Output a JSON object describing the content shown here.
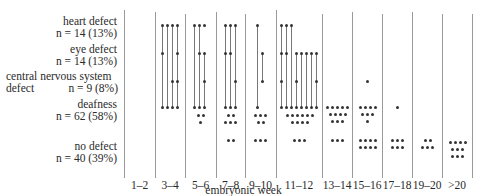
{
  "rows": [
    {
      "key": "heart",
      "label": "heart defect",
      "n": "n = 14 (13%)",
      "y": 25
    },
    {
      "key": "eye",
      "label": "eye defect",
      "n": "n = 14 (13%)",
      "y": 53
    },
    {
      "key": "cns",
      "label": "central nervous system",
      "label2": "defect",
      "n": "n = 9 (8%)",
      "y": 81
    },
    {
      "key": "deaf",
      "label": "deafness",
      "n": "n = 62 (58%)",
      "y": 107
    },
    {
      "key": "none",
      "label": "no defect",
      "n": "n = 40 (39%)",
      "y": 150
    }
  ],
  "x_axis_label": "embryonic week",
  "weeks": [
    "1–2",
    "3–4",
    "5–6",
    "7–8",
    "9–10",
    "11–12",
    "13–14",
    "15–16",
    "17–18",
    "19–20",
    ">20"
  ],
  "column_dividers_x": [
    124,
    155,
    185,
    216,
    245,
    276,
    322,
    352,
    382,
    412,
    442,
    472
  ],
  "chart_data": {
    "type": "scatter",
    "xlabel": "embryonic week",
    "ylabel": "",
    "categories": [
      "1–2",
      "3–4",
      "5–6",
      "7–8",
      "9–10",
      "11–12",
      "13–14",
      "15–16",
      "17–18",
      "19–20",
      ">20"
    ],
    "series": [
      {
        "name": "heart defect n = 14 (13%)",
        "values": [
          0,
          4,
          2,
          3,
          1,
          3,
          0,
          0,
          0,
          0,
          0
        ]
      },
      {
        "name": "eye defect n = 14 (13%)",
        "values": [
          0,
          2,
          3,
          2,
          1,
          7,
          0,
          0,
          0,
          0,
          0
        ]
      },
      {
        "name": "central nervous system defect n = 9 (8%)",
        "values": [
          0,
          2,
          2,
          1,
          1,
          3,
          0,
          1,
          0,
          0,
          0
        ]
      },
      {
        "name": "deafness n = 62 (58%)",
        "values": [
          0,
          4,
          6,
          8,
          6,
          18,
          12,
          8,
          1,
          0,
          0
        ]
      },
      {
        "name": "no defect n = 40 (39%)",
        "values": [
          0,
          0,
          0,
          2,
          3,
          3,
          3,
          8,
          6,
          5,
          10
        ]
      }
    ]
  }
}
